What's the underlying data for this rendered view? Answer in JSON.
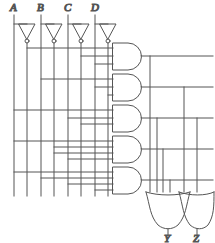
{
  "diagram": {
    "stroke_color": "#555555",
    "label_color": "#1a1a1a",
    "background": "#ffffff",
    "line_width": 1
  },
  "inputs": [
    {
      "name": "A",
      "label": "A",
      "x": 14,
      "bus_true_x": 14,
      "bus_comp_x": 27
    },
    {
      "name": "B",
      "label": "B",
      "x": 41,
      "bus_true_x": 41,
      "bus_comp_x": 54
    },
    {
      "name": "C",
      "label": "C",
      "x": 68,
      "bus_true_x": 68,
      "bus_comp_x": 81
    },
    {
      "name": "D",
      "label": "D",
      "x": 95,
      "bus_true_x": 95,
      "bus_comp_x": 108
    }
  ],
  "inverters": [
    {
      "name": "inverter-a",
      "cx": 27,
      "top_y": 24,
      "tip_y": 40,
      "half_w": 8,
      "bubble_r": 2
    },
    {
      "name": "inverter-b",
      "cx": 54,
      "top_y": 24,
      "tip_y": 40,
      "half_w": 8,
      "bubble_r": 2
    },
    {
      "name": "inverter-c",
      "cx": 81,
      "top_y": 24,
      "tip_y": 40,
      "half_w": 8,
      "bubble_r": 2
    },
    {
      "name": "inverter-d",
      "cx": 108,
      "top_y": 24,
      "tip_y": 40,
      "half_w": 8,
      "bubble_r": 2
    }
  ],
  "bus": {
    "top_y": 16,
    "bottom_y": 196,
    "tap_from_x": 5
  },
  "and_gates": [
    {
      "name": "and-gate-1",
      "x": 113,
      "y": 43,
      "w": 30,
      "h": 27,
      "out_y": 56
    },
    {
      "name": "and-gate-2",
      "x": 113,
      "y": 74,
      "w": 30,
      "h": 27,
      "out_y": 87
    },
    {
      "name": "and-gate-3",
      "x": 113,
      "y": 105,
      "w": 30,
      "h": 27,
      "out_y": 118
    },
    {
      "name": "and-gate-4",
      "x": 113,
      "y": 136,
      "w": 30,
      "h": 27,
      "out_y": 149
    },
    {
      "name": "and-gate-5",
      "x": 113,
      "y": 167,
      "w": 30,
      "h": 27,
      "out_y": 180
    }
  ],
  "or_gates": [
    {
      "name": "or-gate-y",
      "label": "Y",
      "x": 152,
      "y": 192,
      "w": 28,
      "h": 32,
      "out_x": 166,
      "out_y": 232
    },
    {
      "name": "or-gate-z",
      "label": "Z",
      "x": 184,
      "y": 192,
      "w": 26,
      "h": 32,
      "out_x": 197,
      "out_y": 232
    }
  ],
  "outputs": [
    {
      "name": "output-y",
      "label": "Y",
      "x": 166,
      "y": 241
    },
    {
      "name": "output-z",
      "label": "Z",
      "x": 197,
      "y": 241
    }
  ],
  "routing": {
    "and_out_rails_x": [
      150,
      157,
      163,
      170,
      176,
      190,
      197
    ],
    "or_y_input_count": 4,
    "or_z_input_count": 2
  },
  "counts": {
    "inverters": 4,
    "and_gates": 5,
    "or_gates": 2,
    "bus_lines": 8
  }
}
